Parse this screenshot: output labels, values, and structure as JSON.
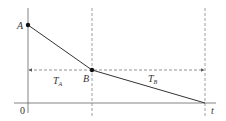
{
  "diagram": {
    "type": "line-graph",
    "axes": {
      "origin_label": "0",
      "x_label": "t"
    },
    "points": {
      "A": {
        "label": "A"
      },
      "B": {
        "label": "B"
      }
    },
    "intervals": {
      "TA": {
        "main": "T",
        "sub": "A"
      },
      "TB": {
        "main": "T",
        "sub": "B"
      }
    },
    "colors": {
      "line": "#333333",
      "axis": "#555555",
      "dash": "#555555"
    }
  }
}
